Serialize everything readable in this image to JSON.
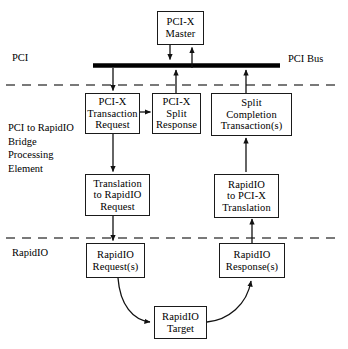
{
  "diagram": {
    "boxes": [
      {
        "id": "pci_x_master",
        "lines": [
          "PCI-X",
          "Master"
        ]
      },
      {
        "id": "pci_x_transaction_request",
        "lines": [
          "PCI-X",
          "Transaction",
          "Request"
        ]
      },
      {
        "id": "pci_x_split_response",
        "lines": [
          "PCI-X",
          "Split",
          "Response"
        ]
      },
      {
        "id": "split_completion_transactions",
        "lines": [
          "Split",
          "Completion",
          "Transaction(s)"
        ]
      },
      {
        "id": "translation_to_rapidio_request",
        "lines": [
          "Translation",
          "to RapidIO",
          "Request"
        ]
      },
      {
        "id": "rapidio_to_pci_x_translation",
        "lines": [
          "RapidIO",
          "to PCI-X",
          "Translation"
        ]
      },
      {
        "id": "rapidio_requests",
        "lines": [
          "RapidIO",
          "Request(s)"
        ]
      },
      {
        "id": "rapidio_responses",
        "lines": [
          "RapidIO",
          "Response(s)"
        ]
      },
      {
        "id": "rapidio_target",
        "lines": [
          "RapidIO",
          "Target"
        ]
      }
    ],
    "labels": {
      "pci_region": [
        "PCI"
      ],
      "bridge_region": [
        "PCI to RapidIO",
        "Bridge",
        "Processing",
        "Element"
      ],
      "rapidio_region": [
        "RapidIO"
      ],
      "pci_bus": "PCI Bus"
    },
    "colors": {
      "stroke": "#1a1a1a",
      "bus": "#000000",
      "divider": "#4d4d4d",
      "background": "#ffffff"
    }
  }
}
